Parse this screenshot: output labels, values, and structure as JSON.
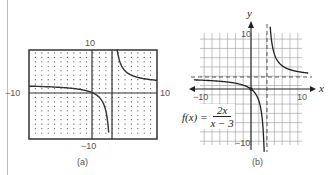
{
  "panel_a": {
    "caption": "(a)",
    "label_top": "10",
    "label_bottom": "−10",
    "label_left": "−10",
    "label_right": "10",
    "window": {
      "xmin": -10,
      "xmax": 10,
      "ymin": -10,
      "ymax": 10
    }
  },
  "panel_b": {
    "caption": "(b)",
    "axis_x_label": "x",
    "axis_y_label": "y",
    "tick_x_neg": "−10",
    "tick_x_pos": "10",
    "tick_y_pos": "10",
    "tick_y_neg": "−10",
    "function_lhs": "f(x) =",
    "function_num": "2x",
    "function_den": "x − 3",
    "vertical_asymptote": "x = 3",
    "horizontal_asymptote": "y = 2"
  },
  "chart_data": [
    {
      "type": "line",
      "title": "(a) graphing calculator view",
      "function": "f(x) = 2x/(x-3)",
      "xlim": [
        -10,
        10
      ],
      "ylim": [
        -10,
        10
      ],
      "grid": "dots",
      "series": [
        {
          "name": "f(x)",
          "x": [
            -10,
            -5,
            -2,
            0,
            1,
            2,
            2.5,
            3.5,
            4,
            5,
            7,
            10
          ],
          "y": [
            1.54,
            1.25,
            0.8,
            0,
            -1,
            -4,
            -10,
            14,
            8,
            5,
            3.5,
            2.86
          ]
        }
      ]
    },
    {
      "type": "line",
      "title": "(b) f(x) = 2x/(x-3)",
      "xlabel": "x",
      "ylabel": "y",
      "xlim": [
        -10,
        10
      ],
      "ylim": [
        -10,
        10
      ],
      "grid": true,
      "asymptotes": {
        "vertical": 3,
        "horizontal": 2
      },
      "series": [
        {
          "name": "f(x)",
          "x": [
            -10,
            -5,
            -2,
            0,
            1,
            2,
            2.5,
            3.5,
            4,
            5,
            7,
            10
          ],
          "y": [
            1.54,
            1.25,
            0.8,
            0,
            -1,
            -4,
            -10,
            14,
            8,
            5,
            3.5,
            2.86
          ]
        }
      ]
    }
  ]
}
